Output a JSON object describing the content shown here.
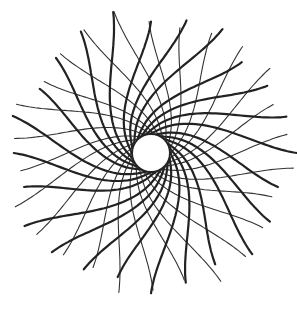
{
  "figure": {
    "center": [
      151,
      153
    ],
    "inner_radius": 18,
    "outer_radius": 146,
    "thick_arms": {
      "count": 24,
      "twist_deg": 150,
      "stroke": "#222222",
      "width": 2.2
    },
    "thin_arms": {
      "count": 26,
      "twist_deg": -110,
      "stroke": "#333333",
      "width": 1.1
    },
    "background": "#ffffff"
  }
}
